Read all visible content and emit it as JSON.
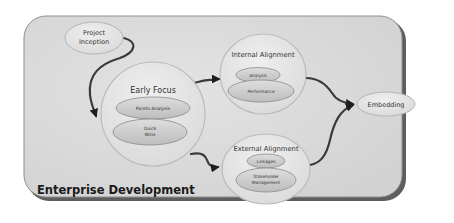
{
  "diagram": {
    "title": "Enterprise Development",
    "nodes": {
      "project_inception": {
        "line1": "Project",
        "line2": "Inception"
      },
      "early_focus": {
        "label": "Early Focus",
        "items": [
          {
            "line1": "Pareto Analysis",
            "line2": ""
          },
          {
            "line1": "Quick",
            "line2": "Wins"
          }
        ]
      },
      "internal_alignment": {
        "label": "Internal Alignment",
        "items": [
          {
            "line1": "Analysis"
          },
          {
            "line1": "Performance"
          }
        ]
      },
      "external_alignment": {
        "label": "External Alignment",
        "items": [
          {
            "line1": "Linkages"
          },
          {
            "line1": "Stakeholder",
            "line2": "Management"
          }
        ]
      },
      "embedding": {
        "label": "Embedding"
      }
    },
    "edges": [
      {
        "from": "Project Inception",
        "to": "Early Focus"
      },
      {
        "from": "Early Focus",
        "to": "Internal Alignment"
      },
      {
        "from": "Early Focus",
        "to": "External Alignment"
      },
      {
        "from": "Internal Alignment",
        "to": "Embedding"
      },
      {
        "from": "External Alignment",
        "to": "Embedding"
      }
    ],
    "colors": {
      "panel_fill": "#d9d9d9",
      "panel_edge": "#5a5a5a",
      "bubble_fill": "#e6e6e6",
      "inner_ellipse_fill": "#cfcfcf",
      "connector": "#3a3a3a"
    }
  }
}
